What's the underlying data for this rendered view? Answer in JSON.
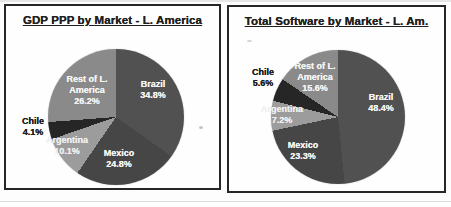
{
  "document": {
    "kind": "scanned slide with two pie charts",
    "background": "#fdfdfd",
    "panel_border_color": "#262626"
  },
  "chart_data": [
    {
      "type": "pie",
      "title": "GDP PPP by Market - L. America",
      "categories": [
        "Brazil",
        "Mexico",
        "Argentina",
        "Chile",
        "Rest of L. America"
      ],
      "values": [
        34.8,
        24.8,
        10.1,
        4.1,
        26.2
      ],
      "unit": "%",
      "colors": [
        "#515151",
        "#464646",
        "#9c9c9c",
        "#262626",
        "#8a8a8a"
      ],
      "start_angle_deg": 0,
      "direction": "clockwise",
      "legend": "none",
      "pie": {
        "cx": 110,
        "cy": 111,
        "r": 68
      },
      "slice_labels": [
        {
          "lines": [
            "Brazil",
            "34.8%"
          ],
          "x": 147,
          "y": 84,
          "color": "#f4f4f4",
          "placement": "inside"
        },
        {
          "lines": [
            "Mexico",
            "24.8%"
          ],
          "x": 113,
          "y": 153,
          "color": "#f4f4f4",
          "placement": "inside"
        },
        {
          "lines": [
            "Argentina",
            "10.1%"
          ],
          "x": 61,
          "y": 140,
          "color": "#efefef",
          "placement": "inside"
        },
        {
          "lines": [
            "Chile",
            "4.1%"
          ],
          "x": 27,
          "y": 121,
          "color": "#1c1c1c",
          "placement": "outside"
        },
        {
          "lines": [
            "Rest of L.",
            "America",
            "26.2%"
          ],
          "x": 81,
          "y": 84,
          "color": "#f4f4f4",
          "placement": "inside"
        }
      ]
    },
    {
      "type": "pie",
      "title": "Total Software by Market - L. Am.",
      "categories": [
        "Brazil",
        "Mexico",
        "Argentina",
        "Chile",
        "Rest of L. America"
      ],
      "values": [
        48.4,
        23.3,
        7.2,
        5.6,
        15.6
      ],
      "unit": "%",
      "colors": [
        "#515151",
        "#464646",
        "#9c9c9c",
        "#262626",
        "#8a8a8a"
      ],
      "start_angle_deg": 0,
      "direction": "clockwise",
      "legend": "none",
      "pie": {
        "cx": 109,
        "cy": 110,
        "r": 67
      },
      "slice_labels": [
        {
          "lines": [
            "Brazil",
            "48.4%"
          ],
          "x": 152,
          "y": 96,
          "color": "#f4f4f4",
          "placement": "inside"
        },
        {
          "lines": [
            "Mexico",
            "23.3%"
          ],
          "x": 74,
          "y": 144,
          "color": "#f4f4f4",
          "placement": "inside"
        },
        {
          "lines": [
            "Argentina",
            "7.2%"
          ],
          "x": 53,
          "y": 108,
          "color": "#efefef",
          "placement": "inside"
        },
        {
          "lines": [
            "Chile",
            "5.6%"
          ],
          "x": 34,
          "y": 71,
          "color": "#1c1c1c",
          "placement": "outside"
        },
        {
          "lines": [
            "Rest of L.",
            "America",
            "15.6%"
          ],
          "x": 86,
          "y": 70,
          "color": "#f4f4f4",
          "placement": "inside"
        }
      ]
    }
  ]
}
